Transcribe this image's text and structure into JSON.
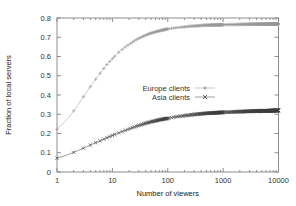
{
  "chart_data": {
    "type": "line",
    "title": "",
    "xlabel": "Number of viewers",
    "ylabel": "Fraction of local servers",
    "xscale": "log",
    "yscale": "linear",
    "xlim": [
      1,
      10000
    ],
    "ylim": [
      0,
      0.8
    ],
    "xticks": [
      1,
      10,
      100,
      1000,
      10000
    ],
    "xticklabels": [
      "1",
      "10",
      "100",
      "1000",
      "10000"
    ],
    "yticks": [
      0,
      0.1,
      0.2,
      0.3,
      0.4,
      0.5,
      0.6,
      0.7,
      0.8
    ],
    "yticklabels": [
      "0",
      "0.1",
      "0.2",
      "0.3",
      "0.4",
      "0.5",
      "0.6",
      "0.7",
      "0.8"
    ],
    "grid": false,
    "legend_position": "center",
    "series": [
      {
        "name": "Europe clients",
        "marker": "plus",
        "color": "#9a9a9a",
        "x": [
          1,
          1.3,
          1.7,
          2.2,
          2.8,
          3.6,
          4.6,
          6,
          7.7,
          10,
          13,
          17,
          22,
          28,
          36,
          46,
          60,
          77,
          100,
          130,
          170,
          220,
          280,
          360,
          460,
          600,
          770,
          1000,
          1300,
          1700,
          2200,
          2800,
          3600,
          4600,
          6000,
          7700,
          10000
        ],
        "y": [
          0.222,
          0.252,
          0.29,
          0.333,
          0.378,
          0.424,
          0.468,
          0.513,
          0.553,
          0.589,
          0.622,
          0.649,
          0.671,
          0.69,
          0.705,
          0.718,
          0.728,
          0.736,
          0.743,
          0.748,
          0.752,
          0.755,
          0.758,
          0.76,
          0.762,
          0.763,
          0.764,
          0.765,
          0.766,
          0.766,
          0.767,
          0.767,
          0.768,
          0.768,
          0.768,
          0.769,
          0.769
        ]
      },
      {
        "name": "Asia clients",
        "marker": "cross",
        "color": "#3c3c3c",
        "x": [
          1,
          1.3,
          1.7,
          2.2,
          2.8,
          3.6,
          4.6,
          6,
          7.7,
          10,
          13,
          17,
          22,
          28,
          36,
          46,
          60,
          77,
          100,
          130,
          170,
          220,
          280,
          360,
          460,
          600,
          770,
          1000,
          1300,
          1700,
          2200,
          2800,
          3600,
          4600,
          6000,
          7700,
          10000
        ],
        "y": [
          0.072,
          0.082,
          0.094,
          0.107,
          0.12,
          0.134,
          0.148,
          0.162,
          0.176,
          0.19,
          0.203,
          0.216,
          0.228,
          0.239,
          0.249,
          0.258,
          0.266,
          0.273,
          0.279,
          0.285,
          0.29,
          0.294,
          0.298,
          0.301,
          0.304,
          0.306,
          0.308,
          0.31,
          0.311,
          0.313,
          0.314,
          0.315,
          0.316,
          0.317,
          0.318,
          0.319,
          0.32
        ]
      }
    ]
  },
  "legend": {
    "entries": [
      {
        "label": "Europe clients",
        "marker": "plus"
      },
      {
        "label": "Asia clients",
        "marker": "cross"
      }
    ]
  }
}
